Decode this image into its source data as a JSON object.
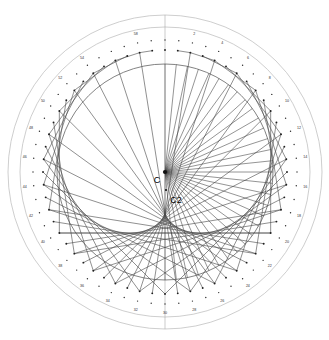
{
  "figure": {
    "background_color": "#ffffff",
    "line_color": "#4a4a4a",
    "ring_color": "#b9b9b9",
    "main_circle_color": "#5a5a5a",
    "label_color": "#2e2e2e"
  },
  "geometry": {
    "center_x": 165,
    "center_y": 172,
    "outer_ring_radius": 157,
    "second_ring_radius": 145,
    "tick_circle_radius": 132,
    "node_circle_radius": 122,
    "main_circle_radius": 108,
    "divisions": 60,
    "fan_apex_x": 165,
    "fan_apex_y": 172
  },
  "center_markers": [
    {
      "name": "C",
      "label": "C",
      "x": 165,
      "y": 172,
      "label_dx": -8,
      "label_dy": 9
    },
    {
      "name": "C2",
      "label": "C2",
      "x": 166,
      "y": 190,
      "label_dx": 10,
      "label_dy": 11
    }
  ],
  "tick_labels": [
    {
      "value": "58",
      "index": 58
    },
    {
      "value": "2",
      "index": 2
    },
    {
      "value": "4",
      "index": 4
    },
    {
      "value": "6",
      "index": 6
    },
    {
      "value": "8",
      "index": 8
    },
    {
      "value": "10",
      "index": 10
    },
    {
      "value": "12",
      "index": 12
    },
    {
      "value": "14",
      "index": 14
    },
    {
      "value": "16",
      "index": 16
    },
    {
      "value": "18",
      "index": 18
    },
    {
      "value": "20",
      "index": 20
    },
    {
      "value": "22",
      "index": 22
    },
    {
      "value": "24",
      "index": 24
    },
    {
      "value": "26",
      "index": 26
    },
    {
      "value": "28",
      "index": 28
    },
    {
      "value": "30",
      "index": 30
    },
    {
      "value": "32",
      "index": 32
    },
    {
      "value": "34",
      "index": 34
    },
    {
      "value": "36",
      "index": 36
    },
    {
      "value": "38",
      "index": 38
    },
    {
      "value": "40",
      "index": 40
    },
    {
      "value": "42",
      "index": 42
    },
    {
      "value": "44",
      "index": 44
    },
    {
      "value": "46",
      "index": 46
    },
    {
      "value": "48",
      "index": 48
    },
    {
      "value": "50",
      "index": 50
    },
    {
      "value": "52",
      "index": 52
    },
    {
      "value": "54",
      "index": 54
    }
  ],
  "chart_data": {
    "type": "scatter",
    "xlabel": "",
    "ylabel": "",
    "grid": false,
    "legend": null,
    "divisions": 60,
    "chord_rule": "n -> 2n mod 60",
    "chord_pairs": [
      [
        1,
        2
      ],
      [
        2,
        4
      ],
      [
        3,
        6
      ],
      [
        4,
        8
      ],
      [
        5,
        10
      ],
      [
        6,
        12
      ],
      [
        7,
        14
      ],
      [
        8,
        16
      ],
      [
        9,
        18
      ],
      [
        10,
        20
      ],
      [
        11,
        22
      ],
      [
        12,
        24
      ],
      [
        13,
        26
      ],
      [
        14,
        28
      ],
      [
        15,
        30
      ],
      [
        16,
        32
      ],
      [
        17,
        34
      ],
      [
        18,
        36
      ],
      [
        19,
        38
      ],
      [
        20,
        40
      ],
      [
        21,
        42
      ],
      [
        22,
        44
      ],
      [
        23,
        46
      ],
      [
        24,
        48
      ],
      [
        25,
        50
      ],
      [
        26,
        52
      ],
      [
        27,
        54
      ],
      [
        28,
        56
      ],
      [
        29,
        58
      ],
      [
        31,
        2
      ],
      [
        32,
        4
      ],
      [
        33,
        6
      ],
      [
        34,
        8
      ],
      [
        35,
        10
      ],
      [
        36,
        12
      ],
      [
        37,
        14
      ],
      [
        38,
        16
      ],
      [
        39,
        18
      ],
      [
        40,
        20
      ],
      [
        41,
        22
      ],
      [
        42,
        24
      ],
      [
        43,
        26
      ],
      [
        44,
        28
      ],
      [
        45,
        30
      ],
      [
        46,
        32
      ],
      [
        47,
        34
      ],
      [
        48,
        36
      ],
      [
        49,
        38
      ],
      [
        50,
        40
      ],
      [
        51,
        42
      ],
      [
        52,
        44
      ],
      [
        53,
        46
      ],
      [
        54,
        48
      ],
      [
        55,
        50
      ],
      [
        56,
        52
      ],
      [
        57,
        54
      ],
      [
        58,
        56
      ],
      [
        59,
        58
      ]
    ],
    "fan_spokes_count": 31,
    "fan_span_degrees": [
      -90,
      90
    ],
    "labelled_ticks": [
      "58",
      "2",
      "4",
      "6",
      "8",
      "10",
      "12",
      "14",
      "16",
      "18",
      "20",
      "22",
      "24",
      "26",
      "28",
      "30",
      "32",
      "34",
      "36",
      "38",
      "40",
      "42",
      "44",
      "46",
      "48",
      "50",
      "52",
      "54"
    ],
    "rings": [
      157,
      145,
      132
    ],
    "points": []
  }
}
